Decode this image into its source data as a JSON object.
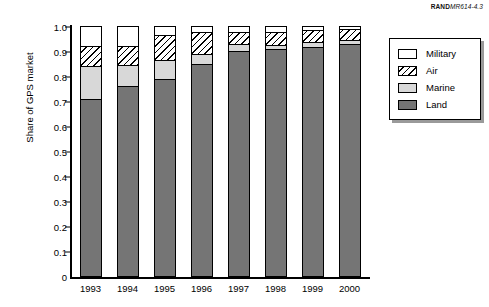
{
  "source_credit": {
    "bold": "RAND",
    "italic": "MR614-4.3"
  },
  "legend": {
    "position": "right",
    "items": [
      {
        "label": "Military",
        "swatch": "white-square-icon"
      },
      {
        "label": "Air",
        "swatch": "diagonal-hatch-square-icon"
      },
      {
        "label": "Marine",
        "swatch": "light-gray-square-icon"
      },
      {
        "label": "Land",
        "swatch": "dark-gray-square-icon"
      }
    ]
  },
  "colors": {
    "land": "#757575",
    "marine": "#d8d8d8",
    "air": "#ffffff",
    "military": "#ffffff",
    "axis": "#000000",
    "legend_shadow": "#9a9a9a"
  },
  "chart_data": {
    "type": "bar",
    "stacked": true,
    "title": "",
    "xlabel": "",
    "ylabel": "Share of GPS market",
    "ylim": [
      0,
      1.0
    ],
    "grid": false,
    "legend_position": "right",
    "categories": [
      "1993",
      "1994",
      "1995",
      "1996",
      "1997",
      "1998",
      "1999",
      "2000"
    ],
    "ytick_labels": [
      "0",
      "0.1",
      "0.2",
      "0.3",
      "0.4",
      "0.5",
      "0.6",
      "0.7",
      "0.8",
      "0.9",
      "1.0"
    ],
    "ytick_values": [
      0,
      0.1,
      0.2,
      0.3,
      0.4,
      0.5,
      0.6,
      0.7,
      0.8,
      0.9,
      1.0
    ],
    "series": [
      {
        "name": "Land",
        "values": [
          0.71,
          0.76,
          0.79,
          0.85,
          0.9,
          0.91,
          0.915,
          0.93
        ]
      },
      {
        "name": "Marine",
        "values": [
          0.13,
          0.085,
          0.075,
          0.04,
          0.03,
          0.015,
          0.02,
          0.015
        ]
      },
      {
        "name": "Air",
        "values": [
          0.08,
          0.075,
          0.1,
          0.085,
          0.045,
          0.05,
          0.05,
          0.045
        ]
      },
      {
        "name": "Military",
        "values": [
          0.08,
          0.08,
          0.035,
          0.025,
          0.025,
          0.025,
          0.015,
          0.01
        ]
      }
    ]
  }
}
